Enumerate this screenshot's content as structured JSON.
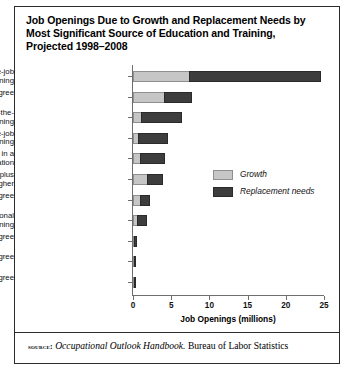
{
  "figure": {
    "title": "Job Openings Due to Growth and Replacement Needs by Most Significant Source of Education and Training, Projected 1998–2008",
    "source": {
      "label": "source:",
      "publication": "Occupational Outlook Handbook.",
      "agency": " Bureau of Labor Statistics"
    }
  },
  "chart_data": {
    "type": "bar",
    "orientation": "horizontal",
    "stacked": true,
    "title": "Job Openings Due to Growth and Replacement Needs by Most Significant Source of Education and Training, Projected 1998–2008",
    "xlabel": "Job Openings (millions)",
    "ylabel": "",
    "xlim": [
      0,
      25
    ],
    "xticks": [
      0,
      5,
      10,
      15,
      20,
      25
    ],
    "xtick_labels": [
      "0",
      "5",
      "10",
      "15",
      "20",
      "25"
    ],
    "grid": false,
    "legend_position": "center-right",
    "categories": [
      "Short-term on-the-job\ntraining",
      "Bachelor's degree",
      "Moderate-term on-the-\njob training",
      "Long-term on-the-job\ntraining",
      "Work experience in a\nrelated occupation",
      "Work experience plus\nbachelor's degree or higher",
      "Associate degree",
      "Postsecondary vocational\ntraining",
      "First professional degree",
      "Doctoral degree",
      "Master's degree"
    ],
    "series": [
      {
        "name": "Growth",
        "color": "#c6c6c6",
        "values": [
          7.5,
          4.2,
          1.2,
          0.8,
          1.0,
          2.0,
          1.0,
          0.7,
          0.15,
          0.12,
          0.2
        ]
      },
      {
        "name": "Replacement needs",
        "color": "#3d3d3d",
        "values": [
          17.2,
          3.7,
          5.4,
          3.9,
          3.3,
          2.0,
          1.3,
          1.3,
          0.45,
          0.3,
          0.35
        ]
      }
    ],
    "totals": [
      24.7,
      7.9,
      6.6,
      4.7,
      4.3,
      4.0,
      2.3,
      2.0,
      0.6,
      0.42,
      0.55
    ]
  },
  "legend": {
    "items": [
      {
        "label": "Growth"
      },
      {
        "label": "Replacement needs"
      }
    ]
  }
}
